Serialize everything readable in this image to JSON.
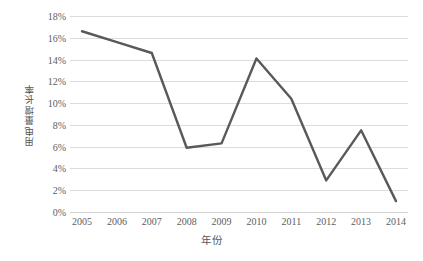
{
  "chart_data": {
    "type": "line",
    "title": "",
    "xlabel": "年份",
    "ylabel": "用电量增长率",
    "categories": [
      "2005",
      "2006",
      "2007",
      "2008",
      "2009",
      "2010",
      "2011",
      "2012",
      "2013",
      "2014"
    ],
    "values": [
      16.6,
      15.6,
      14.6,
      5.9,
      6.3,
      14.1,
      10.4,
      2.9,
      7.5,
      1.0
    ],
    "series": [
      {
        "name": "用电量增长率",
        "values": [
          16.6,
          15.6,
          14.6,
          5.9,
          6.3,
          14.1,
          10.4,
          2.9,
          7.5,
          1.0
        ]
      }
    ],
    "ylim": [
      0,
      18
    ],
    "ytick_values": [
      0,
      2,
      4,
      6,
      8,
      10,
      12,
      14,
      16,
      18
    ],
    "ytick_labels": [
      "0%",
      "2%",
      "4%",
      "6%",
      "8%",
      "10%",
      "12%",
      "14%",
      "16%",
      "18%"
    ],
    "yunit": "%",
    "grid": "horizontal",
    "legend": "none",
    "markers": false,
    "line_color": "#595959",
    "grid_color": "#dcdcdc",
    "text_color": "#5e5e5e",
    "background_color": "#ffffff"
  }
}
